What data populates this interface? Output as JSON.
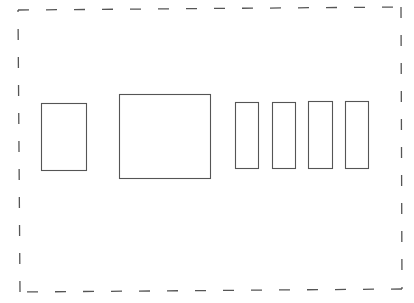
{
  "diagram": {
    "width": 414,
    "height": 303,
    "background": "#ffffff",
    "stroke_color": "#555555",
    "frame": {
      "style": "dashed",
      "corners": {
        "top_left": [
          18,
          10
        ],
        "top_right": [
          401,
          7
        ],
        "bottom_right": [
          402,
          289
        ],
        "bottom_left": [
          20,
          292
        ]
      },
      "dash_length": 11,
      "gap_length": 17,
      "stroke_width": 1.3
    },
    "boxes": [
      {
        "id": "box-1",
        "x": 41,
        "y": 103,
        "w": 45,
        "h": 67
      },
      {
        "id": "box-2",
        "x": 119,
        "y": 94,
        "w": 91,
        "h": 84
      },
      {
        "id": "box-3",
        "x": 235,
        "y": 102,
        "w": 23,
        "h": 66
      },
      {
        "id": "box-4",
        "x": 272,
        "y": 102,
        "w": 23,
        "h": 66
      },
      {
        "id": "box-5",
        "x": 308,
        "y": 101,
        "w": 24,
        "h": 67
      },
      {
        "id": "box-6",
        "x": 345,
        "y": 101,
        "w": 23,
        "h": 67
      }
    ],
    "box_stroke_width": 1.1
  }
}
